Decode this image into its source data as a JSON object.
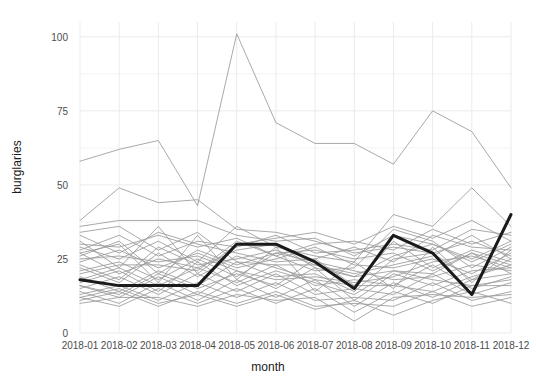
{
  "chart_data": {
    "type": "line",
    "title": "",
    "xlabel": "month",
    "ylabel": "burglaries",
    "categories": [
      "2018-01",
      "2018-02",
      "2018-03",
      "2018-04",
      "2018-05",
      "2018-06",
      "2018-07",
      "2018-08",
      "2018-09",
      "2018-10",
      "2018-11",
      "2018-12"
    ],
    "ylim": [
      0,
      105
    ],
    "yticks": [
      0,
      25,
      50,
      75,
      100
    ],
    "ytick_labels": [
      "0",
      "25",
      "50",
      "75",
      "100"
    ],
    "grid": true,
    "legend": "none",
    "highlight_color": "#1a1a1a",
    "background_color": "#ffffff",
    "grid_color": "#ebebeb",
    "series": [
      {
        "name": "highlighted",
        "highlight": true,
        "color": "#1a1a1a",
        "width": 3.0,
        "values": [
          18,
          16,
          16,
          16,
          30,
          30,
          24,
          15,
          33,
          27,
          13,
          40
        ]
      },
      {
        "name": "area-01",
        "color": "#9a9a9a",
        "width": 1.0,
        "values": [
          58,
          62,
          65,
          43,
          101,
          71,
          64,
          64,
          57,
          75,
          68,
          49
        ]
      },
      {
        "name": "area-02",
        "color": "#9a9a9a",
        "width": 1.0,
        "values": [
          38,
          49,
          44,
          45,
          35,
          34,
          31,
          27,
          29,
          27,
          31,
          26
        ]
      },
      {
        "name": "area-03",
        "color": "#9a9a9a",
        "width": 1.0,
        "values": [
          36,
          38,
          38,
          38,
          33,
          31,
          32,
          26,
          33,
          30,
          25,
          31
        ]
      },
      {
        "name": "area-04",
        "color": "#9a9a9a",
        "width": 1.0,
        "values": [
          29,
          25,
          31,
          24,
          36,
          29,
          26,
          24,
          40,
          36,
          49,
          36
        ]
      },
      {
        "name": "area-05",
        "color": "#9a9a9a",
        "width": 1.0,
        "values": [
          27,
          20,
          25,
          22,
          28,
          30,
          22,
          19,
          26,
          30,
          24,
          30
        ]
      },
      {
        "name": "area-06",
        "color": "#9a9a9a",
        "width": 1.0,
        "values": [
          24,
          28,
          22,
          27,
          22,
          25,
          29,
          23,
          22,
          25,
          20,
          27
        ]
      },
      {
        "name": "area-07",
        "color": "#9a9a9a",
        "width": 1.0,
        "values": [
          22,
          17,
          27,
          19,
          26,
          22,
          18,
          16,
          31,
          22,
          28,
          24
        ]
      },
      {
        "name": "area-08",
        "color": "#9a9a9a",
        "width": 1.0,
        "values": [
          21,
          24,
          18,
          25,
          19,
          27,
          24,
          21,
          18,
          19,
          23,
          21
        ]
      },
      {
        "name": "area-09",
        "color": "#9a9a9a",
        "width": 1.0,
        "values": [
          19,
          14,
          21,
          16,
          24,
          19,
          20,
          14,
          25,
          27,
          18,
          25
        ]
      },
      {
        "name": "area-10",
        "color": "#9a9a9a",
        "width": 1.0,
        "values": [
          18,
          22,
          16,
          22,
          17,
          23,
          16,
          18,
          16,
          23,
          15,
          19
        ]
      },
      {
        "name": "area-11",
        "color": "#9a9a9a",
        "width": 1.0,
        "values": [
          16,
          12,
          19,
          13,
          21,
          15,
          22,
          11,
          20,
          16,
          21,
          22
        ]
      },
      {
        "name": "area-12",
        "color": "#9a9a9a",
        "width": 1.0,
        "values": [
          15,
          19,
          13,
          20,
          14,
          20,
          13,
          15,
          13,
          20,
          13,
          17
        ]
      },
      {
        "name": "area-13",
        "color": "#9a9a9a",
        "width": 1.0,
        "values": [
          14,
          10,
          17,
          11,
          18,
          12,
          18,
          9,
          17,
          12,
          18,
          20
        ]
      },
      {
        "name": "area-14",
        "color": "#9a9a9a",
        "width": 1.0,
        "values": [
          13,
          16,
          11,
          17,
          12,
          17,
          11,
          12,
          11,
          17,
          11,
          14
        ]
      },
      {
        "name": "area-15",
        "color": "#9a9a9a",
        "width": 1.0,
        "values": [
          12,
          9,
          15,
          10,
          15,
          10,
          15,
          7,
          14,
          10,
          16,
          18
        ]
      },
      {
        "name": "area-16",
        "color": "#9a9a9a",
        "width": 1.0,
        "values": [
          11,
          14,
          9,
          14,
          10,
          14,
          9,
          10,
          9,
          14,
          9,
          12
        ]
      },
      {
        "name": "area-17",
        "color": "#9a9a9a",
        "width": 1.0,
        "values": [
          26,
          31,
          20,
          28,
          23,
          27,
          28,
          25,
          27,
          21,
          27,
          23
        ]
      },
      {
        "name": "area-18",
        "color": "#9a9a9a",
        "width": 1.0,
        "values": [
          33,
          27,
          34,
          30,
          27,
          24,
          25,
          29,
          24,
          33,
          29,
          28
        ]
      },
      {
        "name": "area-19",
        "color": "#9a9a9a",
        "width": 1.0,
        "values": [
          20,
          23,
          23,
          21,
          31,
          26,
          21,
          22,
          35,
          31,
          22,
          29
        ]
      },
      {
        "name": "area-20",
        "color": "#9a9a9a",
        "width": 1.0,
        "values": [
          17,
          21,
          14,
          24,
          16,
          21,
          17,
          13,
          21,
          18,
          16,
          16
        ]
      },
      {
        "name": "area-21",
        "color": "#9a9a9a",
        "width": 1.0,
        "values": [
          23,
          18,
          29,
          23,
          25,
          28,
          23,
          20,
          23,
          26,
          33,
          25
        ]
      },
      {
        "name": "area-22",
        "color": "#9a9a9a",
        "width": 1.0,
        "values": [
          25,
          26,
          24,
          26,
          21,
          18,
          19,
          17,
          19,
          24,
          26,
          22
        ]
      },
      {
        "name": "area-23",
        "color": "#9a9a9a",
        "width": 1.0,
        "values": [
          28,
          33,
          26,
          31,
          29,
          33,
          27,
          28,
          30,
          28,
          35,
          33
        ]
      },
      {
        "name": "area-24",
        "color": "#9a9a9a",
        "width": 1.0,
        "values": [
          30,
          29,
          33,
          29,
          32,
          26,
          30,
          31,
          28,
          35,
          30,
          34
        ]
      },
      {
        "name": "area-25",
        "color": "#9a9a9a",
        "width": 1.0,
        "values": [
          34,
          36,
          28,
          34,
          24,
          23,
          23,
          19,
          21,
          20,
          27,
          20
        ]
      },
      {
        "name": "area-26",
        "color": "#9a9a9a",
        "width": 1.0,
        "values": [
          10,
          12,
          12,
          9,
          13,
          11,
          12,
          4,
          12,
          13,
          12,
          13
        ]
      },
      {
        "name": "area-27",
        "color": "#9a9a9a",
        "width": 1.0,
        "values": [
          12,
          15,
          10,
          13,
          9,
          13,
          8,
          11,
          6,
          11,
          14,
          10
        ]
      },
      {
        "name": "area-28",
        "color": "#9a9a9a",
        "width": 1.0,
        "values": [
          16,
          13,
          20,
          15,
          20,
          16,
          25,
          16,
          16,
          14,
          19,
          23
        ]
      },
      {
        "name": "area-29",
        "color": "#9a9a9a",
        "width": 1.0,
        "values": [
          31,
          22,
          36,
          20,
          30,
          32,
          34,
          30,
          36,
          32,
          38,
          31
        ]
      },
      {
        "name": "area-30",
        "color": "#9a9a9a",
        "width": 1.0,
        "values": [
          27,
          30,
          17,
          33,
          18,
          29,
          14,
          24,
          15,
          29,
          17,
          28
        ]
      }
    ]
  },
  "axes": {
    "x_title": "month",
    "y_title": "burglaries"
  }
}
